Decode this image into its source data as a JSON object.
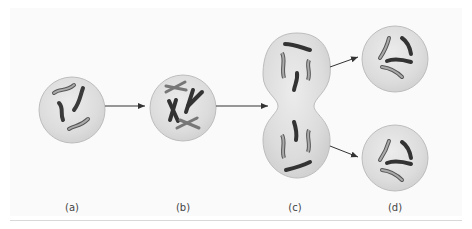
{
  "figure": {
    "type": "diagram",
    "stages": [
      {
        "id": "a",
        "label": "(a)",
        "description": "cell with unreplicated chromosomes"
      },
      {
        "id": "b",
        "label": "(b)",
        "description": "cell with replicated X-shaped chromosomes"
      },
      {
        "id": "c",
        "label": "(c)",
        "description": "dividing cell pinching into two"
      },
      {
        "id": "d",
        "label": "(d)",
        "description": "two daughter cells"
      }
    ],
    "colors": {
      "cell_fill": "#dedede",
      "cell_stroke": "#b5b5b5",
      "dark_chromosome": "#3a3a3a",
      "light_chromosome": "#9a9a9a",
      "arrow": "#333333"
    }
  }
}
